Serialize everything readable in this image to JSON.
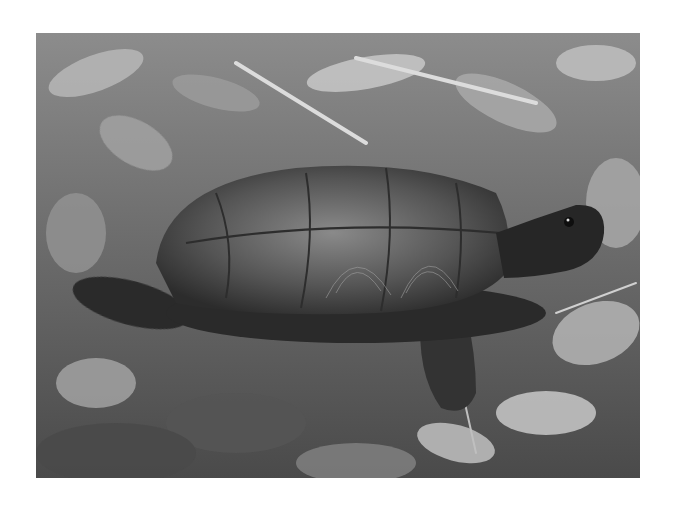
{
  "image": {
    "subject": "Wood turtle walking on forest floor leaf litter",
    "color_mode": "grayscale",
    "frame": {
      "x": 36,
      "y": 33,
      "width": 604,
      "height": 445
    },
    "background_color": "#ffffff",
    "palette": {
      "dark": "#1e1e1e",
      "mid": "#6f6f6f",
      "light": "#c8c8c8",
      "shell": "#4a4a4a",
      "shell_light": "#8a8a8a"
    }
  }
}
